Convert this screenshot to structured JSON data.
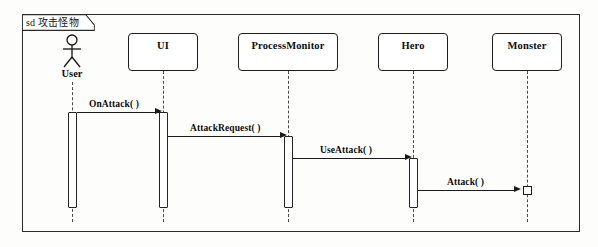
{
  "diagram": {
    "kind_label": "sd",
    "frame_label": "sd 攻击怪物",
    "title": "攻击怪物"
  },
  "participants": [
    {
      "id": "user",
      "name": "User",
      "type": "actor"
    },
    {
      "id": "ui",
      "name": "UI",
      "type": "object"
    },
    {
      "id": "processmonitor",
      "name": "ProcessMonitor",
      "type": "object"
    },
    {
      "id": "hero",
      "name": "Hero",
      "type": "object"
    },
    {
      "id": "monster",
      "name": "Monster",
      "type": "object"
    }
  ],
  "messages": [
    {
      "id": "m1",
      "label": "OnAttack( )",
      "from": "user",
      "to": "ui"
    },
    {
      "id": "m2",
      "label": "AttackRequest( )",
      "from": "ui",
      "to": "processmonitor"
    },
    {
      "id": "m3",
      "label": "UseAttack( )",
      "from": "processmonitor",
      "to": "hero"
    },
    {
      "id": "m4",
      "label": "Attack( )",
      "from": "hero",
      "to": "monster"
    }
  ],
  "colors": {
    "line": "#1a1a1a",
    "lifeline": "#4a4a4a",
    "frame": "#2b2b2b",
    "background": "#fdfdfb"
  }
}
